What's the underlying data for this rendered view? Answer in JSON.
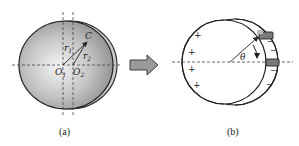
{
  "panels": [
    {
      "id": "a",
      "caption": "(a)",
      "labels": {
        "point_c": "C",
        "radius_1": "r",
        "radius_1_sub": "1",
        "radius_2": "r",
        "radius_2_sub": "2",
        "origin_1": "O",
        "origin_1_sub": "1",
        "origin_2": "O",
        "origin_2_sub": "2"
      },
      "description": "Eccentric sphere: shaded circle centered at O1 with offset crescent toward O2; radius vectors r1 and r2 to point C"
    },
    {
      "id": "b",
      "caption": "(b)",
      "labels": {
        "angle": "θ",
        "positive_signs": [
          "+",
          "+",
          "+",
          "+"
        ],
        "negative_signs": [
          "−",
          "−",
          "−",
          "−"
        ]
      },
      "description": "Two offset circles forming a gap band; plus signs on left band, minus signs on right band, two rectangular sensors on right with angle θ"
    }
  ],
  "arrow": {
    "direction": "right",
    "fill": "#9a9a9a"
  },
  "colors": {
    "stroke": "#222222",
    "sphere_light": "#f0f0f0",
    "sphere_dark": "#8a8a8a",
    "crescent": "#c8c8c8",
    "sensor": "#777777"
  }
}
